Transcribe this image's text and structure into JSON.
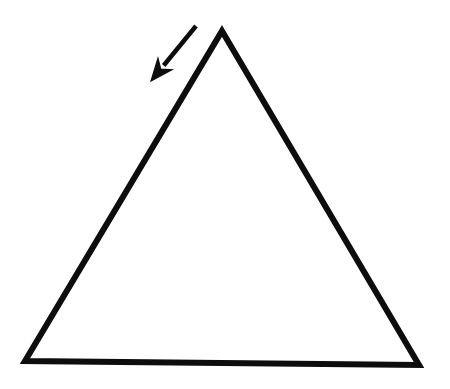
{
  "canvas": {
    "width": 450,
    "height": 389,
    "background_color": "#ffffff",
    "ink_color": "#0d0d0d",
    "title": "Triangle with annotation arrow"
  },
  "figure": {
    "name": "triangle-with-arrow",
    "shapes": [
      {
        "id": "triangle",
        "type": "polygon",
        "label": "triangle-outline",
        "filled": false,
        "stroke_color": "#0d0d0d",
        "stroke_width": 6,
        "vertices": [
          {
            "name": "apex",
            "x": 222,
            "y": 31
          },
          {
            "name": "bottom-right",
            "x": 419,
            "y": 365
          },
          {
            "name": "bottom-left",
            "x": 25,
            "y": 361
          }
        ]
      },
      {
        "id": "arrow",
        "type": "arrow",
        "label": "annotation-arrow",
        "stroke_color": "#0d0d0d",
        "stroke_width": 4,
        "direction": "down-left",
        "tail": {
          "x": 196,
          "y": 26
        },
        "tip": {
          "x": 151,
          "y": 81
        },
        "head": {
          "style": "barbed",
          "length": 22,
          "half_width": 9
        }
      }
    ]
  },
  "chart_data": {
    "type": "diagram",
    "elements": [
      "triangle-outline",
      "annotation-arrow"
    ],
    "annotations": []
  }
}
